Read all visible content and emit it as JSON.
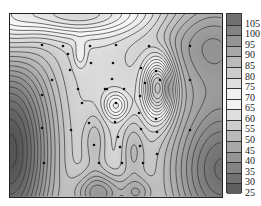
{
  "chart_data": {
    "type": "contour",
    "title": "",
    "xlabel": "",
    "ylabel": "",
    "colorbar": {
      "levels": [
        105,
        100,
        95,
        90,
        85,
        80,
        75,
        70,
        65,
        60,
        55,
        50,
        45,
        40,
        35,
        30,
        25
      ],
      "min": 25,
      "max": 105,
      "step": 5,
      "label_texts": [
        "105",
        "100",
        "95",
        "90",
        "85",
        "80",
        "75",
        "70",
        "65",
        "60",
        "55",
        "50",
        "45",
        "40",
        "35",
        "30",
        "25"
      ]
    },
    "field_model": {
      "base": 62,
      "bumps": [
        {
          "x": 0.7,
          "y": 0.4,
          "sx": 0.05,
          "sy": 0.12,
          "a": 30
        },
        {
          "x": 0.5,
          "y": 0.5,
          "sx": 0.04,
          "sy": 0.05,
          "a": 12
        },
        {
          "x": 0.33,
          "y": 0.22,
          "sx": 0.02,
          "sy": 0.05,
          "a": 6
        },
        {
          "x": 0.3,
          "y": 0.0,
          "sx": 0.25,
          "sy": 0.08,
          "a": 18
        },
        {
          "x": 0.0,
          "y": 0.75,
          "sx": 0.14,
          "sy": 0.4,
          "a": -38
        },
        {
          "x": 1.0,
          "y": 0.85,
          "sx": 0.18,
          "sy": 0.3,
          "a": -30
        },
        {
          "x": 0.0,
          "y": 0.1,
          "sx": 0.1,
          "sy": 0.15,
          "a": 10
        },
        {
          "x": 0.42,
          "y": 0.98,
          "sx": 0.08,
          "sy": 0.08,
          "a": -18
        },
        {
          "x": 0.6,
          "y": 0.98,
          "sx": 0.05,
          "sy": 0.06,
          "a": -10
        },
        {
          "x": 0.95,
          "y": 0.15,
          "sx": 0.2,
          "sy": 0.2,
          "a": -18
        },
        {
          "x": 0.58,
          "y": 0.75,
          "sx": 0.04,
          "sy": 0.12,
          "a": -8
        },
        {
          "x": 0.4,
          "y": 0.7,
          "sx": 0.04,
          "sy": 0.12,
          "a": -8
        }
      ]
    },
    "sample_points": [
      [
        42,
        45
      ],
      [
        63,
        46
      ],
      [
        68,
        54
      ],
      [
        90,
        46
      ],
      [
        91,
        63
      ],
      [
        70,
        70
      ],
      [
        52,
        80
      ],
      [
        42,
        95
      ],
      [
        78,
        89
      ],
      [
        105,
        89
      ],
      [
        82,
        103
      ],
      [
        42,
        128
      ],
      [
        71,
        130
      ],
      [
        89,
        123
      ],
      [
        94,
        145
      ],
      [
        44,
        163
      ],
      [
        99,
        163
      ],
      [
        116,
        45
      ],
      [
        149,
        46
      ],
      [
        190,
        46
      ],
      [
        113,
        63
      ],
      [
        112,
        79
      ],
      [
        141,
        68
      ],
      [
        156,
        71
      ],
      [
        160,
        80
      ],
      [
        190,
        80
      ],
      [
        107,
        89
      ],
      [
        124,
        89
      ],
      [
        145,
        83
      ],
      [
        116,
        103
      ],
      [
        140,
        96
      ],
      [
        139,
        113
      ],
      [
        115,
        122
      ],
      [
        141,
        129
      ],
      [
        156,
        119
      ],
      [
        118,
        137
      ],
      [
        140,
        146
      ],
      [
        157,
        132
      ],
      [
        122,
        163
      ],
      [
        143,
        163
      ],
      [
        157,
        154
      ],
      [
        190,
        130
      ],
      [
        120,
        147
      ]
    ]
  }
}
